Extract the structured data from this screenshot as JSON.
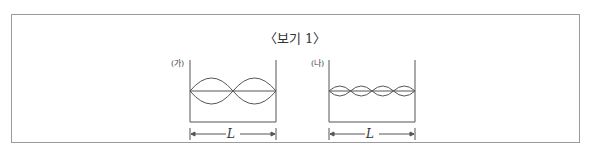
{
  "title": "〈보기 1〉",
  "panels": [
    {
      "label": "(가)",
      "dimension_label": "L",
      "standing_wave_loops": 2
    },
    {
      "label": "(나)",
      "dimension_label": "L",
      "standing_wave_loops": 4
    }
  ]
}
